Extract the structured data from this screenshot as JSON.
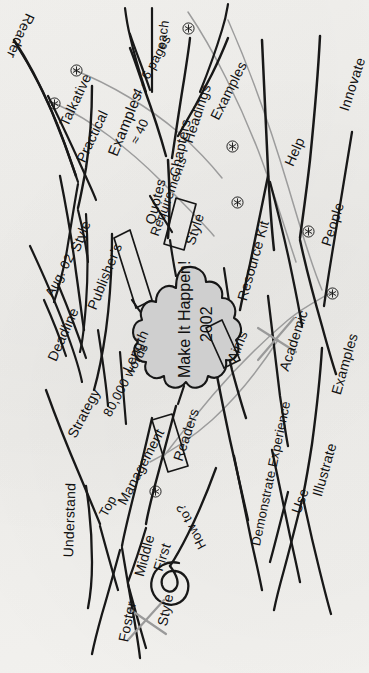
{
  "document": {
    "title": "Make It Happen! 2002 mind map",
    "medium": "hand-drawn mind map on paper, rotated 90 degrees counter-clockwise",
    "paper_color": "#f2f1ee",
    "ink_color": "#181818",
    "cloud_fill": "#cfcfcf",
    "accent_grey": "#9c9c9c"
  },
  "center": {
    "line1": "Make It Happen!",
    "line2": "2002"
  },
  "boxed_nodes": [
    {
      "label": "Style"
    },
    {
      "label": "Requirements"
    },
    {
      "label": "Aims"
    },
    {
      "label": "Readers"
    }
  ],
  "branches": [
    {
      "label": "Reader"
    },
    {
      "label": "Talkative"
    },
    {
      "label": "Practical"
    },
    {
      "label": "Examples"
    },
    {
      "label": "4 - 6 pages"
    },
    {
      "label": "each"
    },
    {
      "label": "≈ 40"
    },
    {
      "label": "Chapters"
    },
    {
      "label": "Headings"
    },
    {
      "label": "Examples"
    },
    {
      "label": "Quotes"
    },
    {
      "label": "Style"
    },
    {
      "label": "Publisher's"
    },
    {
      "label": "Aug. 02"
    },
    {
      "label": "Deadline"
    },
    {
      "label": "Requirements"
    },
    {
      "label": "Length"
    },
    {
      "label": "80,000 words"
    },
    {
      "label": "Strategy"
    },
    {
      "label": "Understand"
    },
    {
      "label": "Top"
    },
    {
      "label": "Management"
    },
    {
      "label": "Middle"
    },
    {
      "label": "First"
    },
    {
      "label": "Foster"
    },
    {
      "label": "Style"
    },
    {
      "label": "Readers"
    },
    {
      "label": "How to?"
    },
    {
      "label": "Aims"
    },
    {
      "label": "Demonstrate Experience"
    },
    {
      "label": "Resource Kit"
    },
    {
      "label": "Help"
    },
    {
      "label": "People"
    },
    {
      "label": "Innovate"
    },
    {
      "label": "Academic"
    },
    {
      "label": "Examples"
    },
    {
      "label": "Illustrate"
    },
    {
      "label": "Use"
    }
  ],
  "labels": {
    "reader": "Reader",
    "talkative": "Talkative",
    "practical": "Practical",
    "examples_left": "Examples",
    "pages_46": "4 - 6 pages",
    "each": "each",
    "approx40": "≈ 40",
    "chapters": "Chapters",
    "headings": "Headings",
    "examples_top": "Examples",
    "quotes": "Quotes",
    "style_box": "Style",
    "publishers": "Publisher's",
    "style_pub": "Style",
    "aug02": "Aug. 02",
    "deadline": "Deadline",
    "requirements": "Requirements",
    "length": "Length",
    "words80k": "80,000 words",
    "strategy": "Strategy",
    "understand": "Understand",
    "top": "Top",
    "management": "Management",
    "middle": "Middle",
    "first": "First",
    "foster": "Foster",
    "style_struck": "Style",
    "readers_box": "Readers",
    "howto": "How to?",
    "aims_box": "Aims",
    "demonstrate": "Demonstrate Experience",
    "resource_kit": "Resource Kit",
    "help": "Help",
    "people": "People",
    "innovate": "Innovate",
    "academic_struck": "Academic",
    "examples_right": "Examples",
    "illustrate": "Illustrate",
    "use": "Use"
  },
  "markers": {
    "glyph": "asterisk-in-circle",
    "count": 9,
    "meaning": "emphasis marker"
  },
  "struck_out": [
    {
      "label": "Style"
    },
    {
      "label": "Academic"
    }
  ]
}
